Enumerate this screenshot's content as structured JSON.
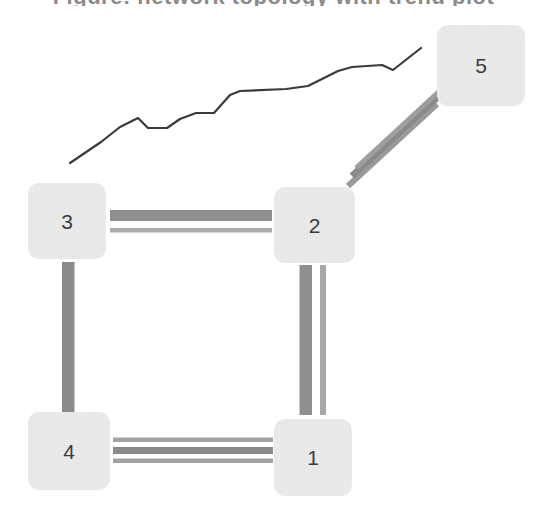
{
  "figure": {
    "title_remnant": "Figure: network topology with trend plot",
    "background_color": "#ffffff",
    "width": 547,
    "height": 515
  },
  "palette": {
    "node_fill": "#ececec",
    "node_text": "#3d3d3d",
    "edge_thick": "#8f8f8f",
    "edge_thin": "#ababab",
    "chart_line": "#3a3a3a"
  },
  "nodes": [
    {
      "id": "5",
      "label": "5",
      "x": 437,
      "y": 25,
      "w": 88,
      "h": 81
    },
    {
      "id": "3",
      "label": "3",
      "x": 28,
      "y": 183,
      "w": 78,
      "h": 76
    },
    {
      "id": "2",
      "label": "2",
      "x": 274,
      "y": 187,
      "w": 81,
      "h": 76
    },
    {
      "id": "4",
      "label": "4",
      "x": 28,
      "y": 412,
      "w": 82,
      "h": 78
    },
    {
      "id": "1",
      "label": "1",
      "x": 274,
      "y": 419,
      "w": 78,
      "h": 77
    }
  ],
  "edges": [
    {
      "id": "e-3-2",
      "from": "3",
      "to": "2",
      "orientation": "horizontal",
      "line_count": 2
    },
    {
      "id": "e-4-1",
      "from": "4",
      "to": "1",
      "orientation": "horizontal",
      "line_count": 3
    },
    {
      "id": "e-3-4",
      "from": "3",
      "to": "4",
      "orientation": "vertical",
      "line_count": 1
    },
    {
      "id": "e-2-1",
      "from": "2",
      "to": "1",
      "orientation": "vertical",
      "line_count": 2
    },
    {
      "id": "e-2-5",
      "from": "2",
      "to": "5",
      "orientation": "diagonal",
      "line_count": 3
    }
  ],
  "chart_data": {
    "type": "line",
    "title": "",
    "xlabel": "",
    "ylabel": "",
    "grid": false,
    "legend": null,
    "xlim": [
      70,
      421
    ],
    "ylim": [
      163,
      48
    ],
    "series": [
      {
        "name": "trend",
        "points": [
          [
            70,
            163
          ],
          [
            101,
            142
          ],
          [
            120,
            127
          ],
          [
            138,
            118
          ],
          [
            148,
            128
          ],
          [
            167,
            128
          ],
          [
            180,
            119
          ],
          [
            196,
            113
          ],
          [
            214,
            113
          ],
          [
            230,
            95
          ],
          [
            240,
            91
          ],
          [
            286,
            89
          ],
          [
            308,
            86
          ],
          [
            338,
            71
          ],
          [
            352,
            67
          ],
          [
            382,
            65
          ],
          [
            393,
            70
          ],
          [
            421,
            48
          ]
        ]
      }
    ]
  }
}
